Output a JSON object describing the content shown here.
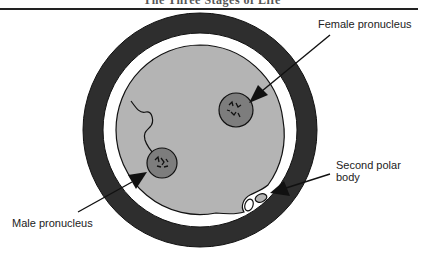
{
  "header": {
    "running_title": "The Three Stages of Life"
  },
  "diagram": {
    "colors": {
      "zona": "#2e2e2e",
      "perivitelline_space": "#ffffff",
      "cytoplasm": "#b4b4b4",
      "pronucleus": "#7d7d7d",
      "outline": "#111111"
    },
    "labels": {
      "female_pronucleus": "Female pronucleus",
      "second_polar_body_line1": "Second polar",
      "second_polar_body_line2": "body",
      "male_pronucleus": "Male pronucleus"
    }
  }
}
